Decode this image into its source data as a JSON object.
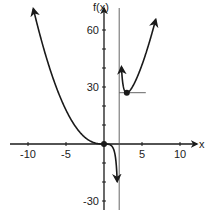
{
  "chart_data": {
    "type": "line",
    "title": "",
    "function": "f(x) = x^3 / (x - 2)",
    "xlabel": "x",
    "ylabel": "f(x)",
    "xlim": [
      -12,
      11.5
    ],
    "ylim": [
      -35,
      67
    ],
    "x_ticks": [
      -10,
      -5,
      5,
      10
    ],
    "x_tick_labels": [
      "-10",
      "-5",
      "5",
      "10"
    ],
    "y_ticks": [
      -30,
      -20,
      -10,
      10,
      20,
      30,
      40,
      50,
      60
    ],
    "y_tick_labels": {
      "60": "60",
      "30": "30",
      "-30": "-30"
    },
    "grid": false,
    "legend": null,
    "vertical_asymptote": 2,
    "points": [
      {
        "x": 0,
        "y": 0,
        "label": "inflection point (0,0)"
      },
      {
        "x": 3,
        "y": 27,
        "label": "local minimum (3,27)"
      }
    ],
    "tangent_line": {
      "y": 27,
      "x_from": 2,
      "x_to": 5.5
    },
    "series": [
      {
        "name": "left branch",
        "x": [
          -9.3,
          -8,
          -6,
          -4,
          -2,
          -1,
          0,
          1,
          1.5,
          1.7
        ],
        "y": [
          71,
          51.2,
          27,
          10.7,
          2,
          0.33,
          0,
          -1,
          -6.75,
          -16.4
        ]
      },
      {
        "name": "right branch",
        "x": [
          2.3,
          2.5,
          3,
          4,
          5,
          6,
          6.8
        ],
        "y": [
          40.6,
          31.3,
          27,
          32,
          41.7,
          54,
          65.5
        ]
      }
    ],
    "color": "#1a1a1a"
  }
}
